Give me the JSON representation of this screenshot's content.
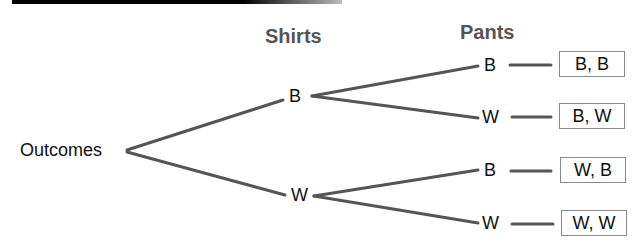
{
  "diagram": {
    "type": "tree-diagram",
    "headers": {
      "level1": "Shirts",
      "level2": "Pants"
    },
    "root": "Outcomes",
    "level1_nodes": [
      "B",
      "W"
    ],
    "level2_nodes": [
      "B",
      "W",
      "B",
      "W"
    ],
    "outcomes": [
      "B, B",
      "B, W",
      "W, B",
      "W, W"
    ],
    "colors": {
      "line": "#555555",
      "text": "#111111",
      "header": "#555555",
      "box_border": "#888888"
    }
  }
}
